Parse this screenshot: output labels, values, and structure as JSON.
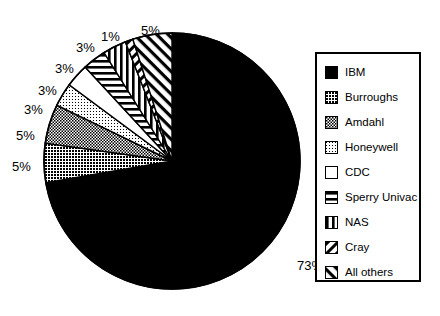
{
  "chart_data": {
    "type": "pie",
    "title": "",
    "subtitle": "",
    "xlabel": "",
    "ylabel": "",
    "grid": false,
    "legend_position": "right",
    "unit": "%",
    "start_angle_deg": 90,
    "direction": "clockwise",
    "categories": [
      "IBM",
      "Burroughs",
      "Amdahl",
      "Honeywell",
      "CDC",
      "Sperry Univac",
      "NAS",
      "Cray",
      "All others"
    ],
    "values": [
      73,
      5,
      5,
      3,
      3,
      3,
      3,
      1,
      5
    ],
    "labels": [
      "73%",
      "5%",
      "5%",
      "3%",
      "3%",
      "3%",
      "3%",
      "1%",
      "5%"
    ],
    "slices": [
      {
        "name": "IBM",
        "value": 73,
        "label": "73%",
        "pattern": "solid-black",
        "label_x": 297,
        "label_y": 259
      },
      {
        "name": "Burroughs",
        "value": 5,
        "label": "5%",
        "pattern": "dense-dots",
        "label_x": 12,
        "label_y": 160
      },
      {
        "name": "Amdahl",
        "value": 5,
        "label": "5%",
        "pattern": "medium-checker",
        "label_x": 16,
        "label_y": 129
      },
      {
        "name": "Honeywell",
        "value": 3,
        "label": "3%",
        "pattern": "light-dots",
        "label_x": 24,
        "label_y": 103
      },
      {
        "name": "CDC",
        "value": 3,
        "label": "3%",
        "pattern": "white",
        "label_x": 38,
        "label_y": 84
      },
      {
        "name": "Sperry Univac",
        "value": 3,
        "label": "3%",
        "pattern": "horizontal-stripes",
        "label_x": 55,
        "label_y": 62
      },
      {
        "name": "NAS",
        "value": 3,
        "label": "3%",
        "pattern": "vertical-stripes",
        "label_x": 76,
        "label_y": 41
      },
      {
        "name": "Cray",
        "value": 1,
        "label": "1%",
        "pattern": "back-diagonal",
        "label_x": 101,
        "label_y": 30
      },
      {
        "name": "All others",
        "value": 5,
        "label": "5%",
        "pattern": "forward-diagonal",
        "label_x": 141,
        "label_y": 24
      }
    ]
  },
  "legend": {
    "items": [
      {
        "label": "IBM",
        "pattern": "solid-black"
      },
      {
        "label": "Burroughs",
        "pattern": "dense-dots"
      },
      {
        "label": "Amdahl",
        "pattern": "medium-checker"
      },
      {
        "label": "Honeywell",
        "pattern": "light-dots"
      },
      {
        "label": "CDC",
        "pattern": "white"
      },
      {
        "label": "Sperry Univac",
        "pattern": "horizontal-stripes"
      },
      {
        "label": "NAS",
        "pattern": "vertical-stripes"
      },
      {
        "label": "Cray",
        "pattern": "back-diagonal"
      },
      {
        "label": "All others",
        "pattern": "forward-diagonal"
      }
    ]
  },
  "colors": {
    "ink": "#000000",
    "paper": "#ffffff"
  },
  "geometry": {
    "center_x": 172,
    "center_y": 161,
    "radius": 128
  }
}
